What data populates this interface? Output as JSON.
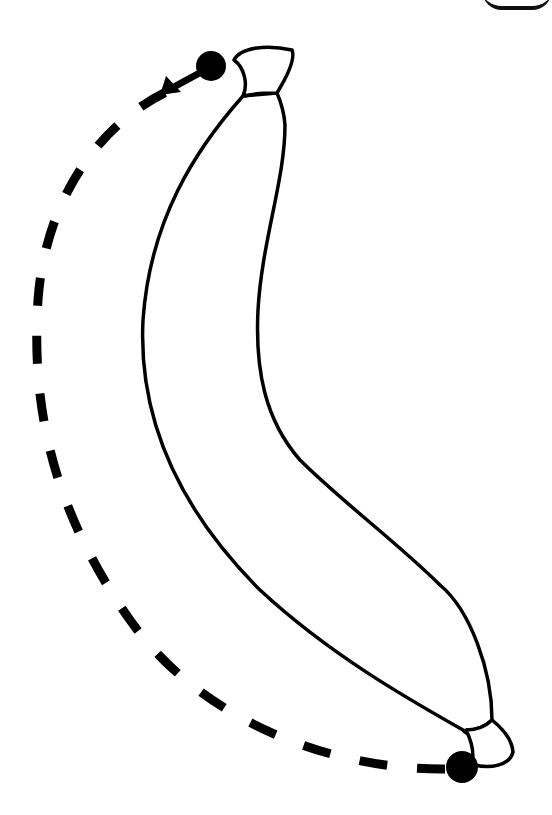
{
  "diagram": {
    "colors": {
      "background": "#ffffff",
      "stroke": "#000000",
      "fill": "#ffffff"
    },
    "elements": {
      "banana_outline": "banana-body",
      "stem": "banana-stem",
      "bottom_tip": "banana-tip",
      "start_point": "bottom-dot",
      "end_point": "top-dot",
      "path": "dashed-arc",
      "direction": "arrow-toward-top-left"
    },
    "points": {
      "start": {
        "x": 462,
        "y": 767
      },
      "end": {
        "x": 211,
        "y": 66
      }
    }
  }
}
